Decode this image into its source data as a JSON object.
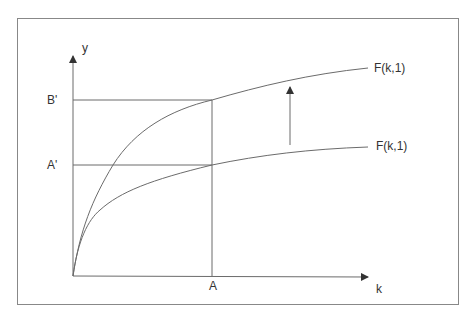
{
  "diagram": {
    "type": "production-function-shift",
    "axes": {
      "y_label": "y",
      "x_label": "k"
    },
    "ticks": {
      "y": [
        "B'",
        "A'"
      ],
      "x": [
        "A"
      ]
    },
    "curves": [
      {
        "id": "upper",
        "label": "F(k,1)"
      },
      {
        "id": "lower",
        "label": "F(k,1)"
      }
    ],
    "shift_arrow": {
      "direction": "up"
    },
    "colors": {
      "line": "#6b6b6b",
      "text": "#333333",
      "frame": "#888888",
      "background": "#ffffff"
    }
  }
}
